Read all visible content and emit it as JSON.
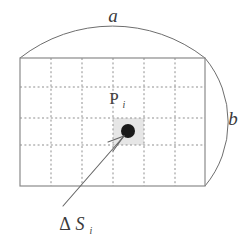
{
  "figure": {
    "kind": "geometry-diagram",
    "labels": {
      "top_arc": "a",
      "right_arc": "b",
      "point": "P",
      "point_subscript": "i",
      "area_element_delta": "Δ",
      "area_element_symbol": "S",
      "area_element_subscript": "i"
    },
    "colors": {
      "outline": "#8a8a8a",
      "arc": "#6e6e6e",
      "grid": "#8f8f8f",
      "cell_fill": "#e6e6e6",
      "dot": "#1a1a1a",
      "arrow": "#666666",
      "text": "#3a3a3a",
      "background": "#ffffff"
    },
    "geometry": {
      "rect": {
        "x": 20,
        "y": 58,
        "width": 185,
        "height": 128
      },
      "grid_columns": 5,
      "grid_rows": 3,
      "grid_x": [
        51,
        82,
        113,
        144,
        175
      ],
      "grid_y": [
        87,
        118,
        145
      ],
      "highlight_cell": {
        "x": 113,
        "y": 118,
        "width": 31,
        "height": 27
      },
      "point": {
        "x": 128,
        "y": 131,
        "r": 7
      },
      "arrow_tail": {
        "x": 63,
        "y": 206
      },
      "arrow_head": {
        "x": 124,
        "y": 136
      }
    }
  }
}
